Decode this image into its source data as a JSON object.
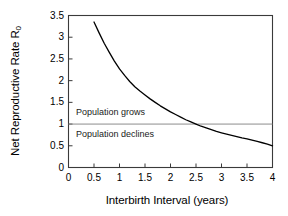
{
  "chart_data": {
    "type": "line",
    "title": "",
    "xlabel": "Interbirth Interval (years)",
    "ylabel": "Net Reproductive Rate R",
    "ylabel_subscript": "0",
    "xlim": [
      0,
      4
    ],
    "ylim": [
      0,
      3.5
    ],
    "xticks": [
      0,
      0.5,
      1,
      1.5,
      2,
      2.5,
      3,
      3.5,
      4
    ],
    "xtick_labels": [
      "0",
      "0.5",
      "1",
      "1.5",
      "2",
      "2.5",
      "3",
      "3.5",
      "4"
    ],
    "yticks": [
      0,
      0.5,
      1,
      1.5,
      2,
      2.5,
      3,
      3.5
    ],
    "ytick_labels": [
      "0",
      "0.5",
      "1",
      "1.5",
      "2",
      "2.5",
      "3",
      "3.5"
    ],
    "grid": false,
    "legend": "none",
    "series": [
      {
        "name": "Net reproductive rate vs interbirth interval",
        "color": "#000000",
        "x": [
          0.5,
          0.6,
          0.7,
          0.8,
          0.9,
          1.0,
          1.1,
          1.2,
          1.3,
          1.4,
          1.5,
          1.6,
          1.7,
          1.8,
          1.9,
          2.0,
          2.1,
          2.2,
          2.3,
          2.4,
          2.5,
          2.6,
          2.7,
          2.8,
          2.9,
          3.0,
          3.1,
          3.2,
          3.3,
          3.4,
          3.5,
          3.6,
          3.7,
          3.8,
          3.9,
          4.0
        ],
        "y": [
          3.35,
          3.1,
          2.86,
          2.65,
          2.45,
          2.27,
          2.12,
          1.98,
          1.86,
          1.76,
          1.67,
          1.58,
          1.5,
          1.42,
          1.35,
          1.28,
          1.22,
          1.16,
          1.1,
          1.05,
          1.0,
          0.95,
          0.91,
          0.87,
          0.83,
          0.8,
          0.77,
          0.74,
          0.71,
          0.68,
          0.66,
          0.63,
          0.6,
          0.57,
          0.54,
          0.5
        ]
      }
    ],
    "reference_lines": [
      {
        "name": "replacement-level",
        "axis": "y",
        "value": 1,
        "color": "#8c8c8c"
      }
    ],
    "annotations": [
      {
        "name": "population-grows",
        "text": "Population grows",
        "x": 0.15,
        "y": 1.3
      },
      {
        "name": "population-declines",
        "text": "Population declines",
        "x": 0.15,
        "y": 0.72
      }
    ]
  }
}
